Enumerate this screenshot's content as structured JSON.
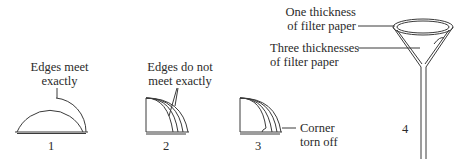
{
  "diagram": {
    "steps": [
      {
        "number": "1",
        "label_line1": "Edges meet",
        "label_line2": "exactly"
      },
      {
        "number": "2",
        "label_line1": "Edges do not",
        "label_line2": "meet exactly"
      },
      {
        "number": "3",
        "label_line1": "Corner",
        "label_line2": "torn off"
      },
      {
        "number": "4",
        "callout_top_line1": "One thickness",
        "callout_top_line2": "of filter paper",
        "callout_mid_line1": "Three thicknesses",
        "callout_mid_line2": "of filter paper"
      }
    ],
    "colors": {
      "ink": "#3a3a3a",
      "background": "#ffffff"
    }
  }
}
